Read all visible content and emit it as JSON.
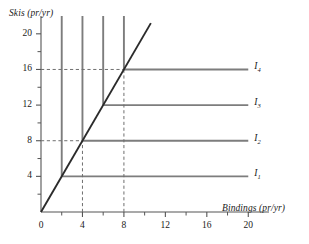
{
  "chart_data": {
    "type": "line",
    "title": "",
    "xlabel": "Bindings (pr/yr)",
    "ylabel": "Skis (pr/yr)",
    "xlim": [
      0,
      22
    ],
    "ylim": [
      0,
      22
    ],
    "grid": false,
    "legend_position": "right-inline",
    "x_major_ticks": [
      0,
      4,
      8,
      12,
      16,
      20
    ],
    "x_minor_ticks": [
      2,
      6,
      10,
      14,
      18
    ],
    "y_major_ticks": [
      4,
      8,
      12,
      16,
      20
    ],
    "y_minor_ticks": [
      2,
      6,
      10,
      14,
      18
    ],
    "x_tick_labels": [
      "0",
      "4",
      "8",
      "12",
      "16",
      "20"
    ],
    "y_tick_labels": [
      "4",
      "8",
      "12",
      "16",
      "20"
    ],
    "series": [
      {
        "name": "I1",
        "label": "I",
        "subscript": "1",
        "type": "isoquant-L",
        "corner": {
          "x": 2,
          "y": 4
        },
        "vertical_top": 22,
        "horizontal_right": 20,
        "color": "#7d7d7d"
      },
      {
        "name": "I2",
        "label": "I",
        "subscript": "2",
        "type": "isoquant-L",
        "corner": {
          "x": 4,
          "y": 8
        },
        "vertical_top": 22,
        "horizontal_right": 20,
        "color": "#7d7d7d"
      },
      {
        "name": "I3",
        "label": "I",
        "subscript": "3",
        "type": "isoquant-L",
        "corner": {
          "x": 6,
          "y": 12
        },
        "vertical_top": 22,
        "horizontal_right": 20,
        "color": "#7d7d7d"
      },
      {
        "name": "I4",
        "label": "I",
        "subscript": "4",
        "type": "isoquant-L",
        "corner": {
          "x": 8,
          "y": 16
        },
        "vertical_top": 22,
        "horizontal_right": 20,
        "color": "#7d7d7d"
      }
    ],
    "ray": {
      "name": "expansion-path",
      "from": {
        "x": 0,
        "y": 0
      },
      "to": {
        "x": 10.6,
        "y": 21.2
      },
      "slope": 2,
      "color": "#2b2b2b"
    },
    "guides": [
      {
        "name": "guide-h-8",
        "orientation": "horizontal",
        "value": 8,
        "from": 0,
        "to": 4
      },
      {
        "name": "guide-h-16",
        "orientation": "horizontal",
        "value": 16,
        "from": 0,
        "to": 8
      },
      {
        "name": "guide-v-4",
        "orientation": "vertical",
        "value": 4,
        "from": 0,
        "to": 8
      },
      {
        "name": "guide-v-8",
        "orientation": "vertical",
        "value": 8,
        "from": 0,
        "to": 16
      }
    ]
  },
  "axes": {
    "y_title": "Skis (pr/yr)",
    "x_title": "Bindings (pr/yr)",
    "y_labels": [
      "20",
      "16",
      "12",
      "8",
      "4"
    ],
    "x_labels": [
      "0",
      "4",
      "8",
      "12",
      "16",
      "20"
    ]
  },
  "isoquant_labels": [
    {
      "base": "I",
      "sub": "4"
    },
    {
      "base": "I",
      "sub": "3"
    },
    {
      "base": "I",
      "sub": "2"
    },
    {
      "base": "I",
      "sub": "1"
    }
  ],
  "colors": {
    "isoquant": "#7d7d7d",
    "ray": "#2b2b2b",
    "axis": "#555555",
    "guide": "#6f6f6f",
    "text": "#1a1a1a",
    "background": "#ffffff"
  }
}
